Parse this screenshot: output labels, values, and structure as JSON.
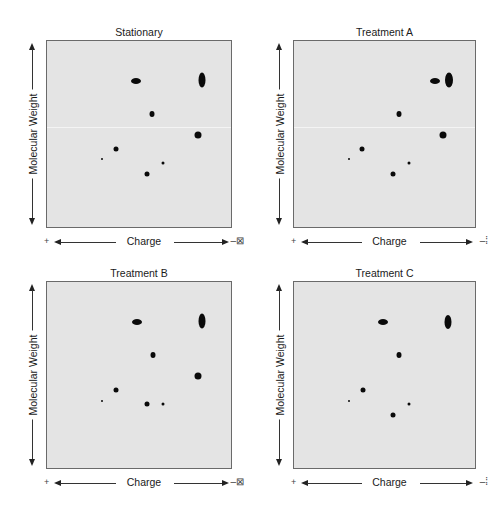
{
  "figure": {
    "axis_labels": {
      "y": "Molecular Weight",
      "x": "Charge",
      "x_left_symbol": "+",
      "x_right_symbol": "–⊠"
    },
    "panels": [
      {
        "title": "Stationary",
        "box": {
          "left": 46,
          "top": 40,
          "width": 186,
          "height": 188
        },
        "right_symbol": "–⊠",
        "spots": [
          {
            "x": 136,
            "y": 81,
            "w": 10,
            "h": 6
          },
          {
            "x": 202,
            "y": 80,
            "w": 7,
            "h": 15
          },
          {
            "x": 152,
            "y": 114,
            "w": 5,
            "h": 6
          },
          {
            "x": 198,
            "y": 135,
            "w": 7,
            "h": 7
          },
          {
            "x": 116,
            "y": 149,
            "w": 5,
            "h": 5
          },
          {
            "x": 102,
            "y": 159,
            "w": 2,
            "h": 2
          },
          {
            "x": 163,
            "y": 163,
            "w": 3,
            "h": 3
          },
          {
            "x": 147,
            "y": 174,
            "w": 5,
            "h": 5
          }
        ]
      },
      {
        "title": "Treatment A",
        "box": {
          "left": 293,
          "top": 40,
          "width": 183,
          "height": 188
        },
        "right_symbol": "–⁞",
        "spots": [
          {
            "x": 435,
            "y": 81,
            "w": 10,
            "h": 6
          },
          {
            "x": 449,
            "y": 80,
            "w": 8,
            "h": 15
          },
          {
            "x": 399,
            "y": 114,
            "w": 5,
            "h": 6
          },
          {
            "x": 443,
            "y": 135,
            "w": 7,
            "h": 7
          },
          {
            "x": 362,
            "y": 149,
            "w": 5,
            "h": 5
          },
          {
            "x": 349,
            "y": 159,
            "w": 2,
            "h": 2
          },
          {
            "x": 409,
            "y": 163,
            "w": 3,
            "h": 3
          },
          {
            "x": 393,
            "y": 174,
            "w": 5,
            "h": 5
          }
        ]
      },
      {
        "title": "Treatment B",
        "box": {
          "left": 46,
          "top": 281,
          "width": 186,
          "height": 188
        },
        "right_symbol": "–⊠",
        "spots": [
          {
            "x": 137,
            "y": 322,
            "w": 10,
            "h": 6
          },
          {
            "x": 202,
            "y": 321,
            "w": 7,
            "h": 15
          },
          {
            "x": 153,
            "y": 355,
            "w": 5,
            "h": 6
          },
          {
            "x": 198,
            "y": 376,
            "w": 7,
            "h": 7
          },
          {
            "x": 116,
            "y": 390,
            "w": 5,
            "h": 5
          },
          {
            "x": 102,
            "y": 401,
            "w": 2,
            "h": 2
          },
          {
            "x": 147,
            "y": 404,
            "w": 5,
            "h": 5
          },
          {
            "x": 163,
            "y": 404,
            "w": 3,
            "h": 3
          }
        ]
      },
      {
        "title": "Treatment C",
        "box": {
          "left": 293,
          "top": 281,
          "width": 183,
          "height": 188
        },
        "right_symbol": "–⁞",
        "spots": [
          {
            "x": 383,
            "y": 322,
            "w": 10,
            "h": 6
          },
          {
            "x": 448,
            "y": 322,
            "w": 7,
            "h": 14
          },
          {
            "x": 399,
            "y": 355,
            "w": 5,
            "h": 6
          },
          {
            "x": 363,
            "y": 390,
            "w": 5,
            "h": 5
          },
          {
            "x": 349,
            "y": 401,
            "w": 2,
            "h": 2
          },
          {
            "x": 409,
            "y": 404,
            "w": 3,
            "h": 3
          },
          {
            "x": 393,
            "y": 415,
            "w": 5,
            "h": 5
          }
        ]
      }
    ]
  },
  "chart_data": {
    "type": "scatter",
    "xlabel": "Charge (+ to −)",
    "ylabel": "Molecular Weight",
    "panels": [
      {
        "name": "Stationary",
        "spot_count": 8
      },
      {
        "name": "Treatment A",
        "spot_count": 8,
        "note": "upper-left oval shifted toward negative charge"
      },
      {
        "name": "Treatment B",
        "spot_count": 8,
        "note": "lower spot shifted up to align with small spot"
      },
      {
        "name": "Treatment C",
        "spot_count": 7,
        "note": "large right-middle spot absent"
      }
    ]
  }
}
